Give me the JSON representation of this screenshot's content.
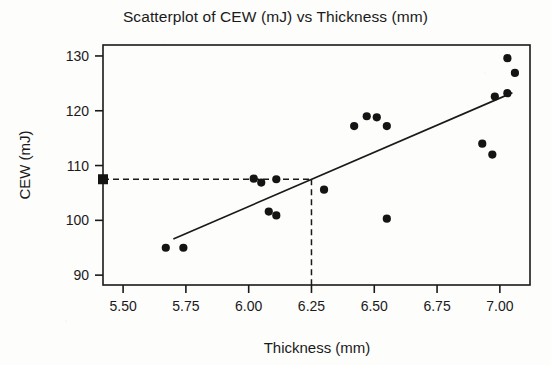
{
  "chart_data": {
    "type": "scatter",
    "title": "Scatterplot of CEW (mJ) vs Thickness (mm)",
    "xlabel": "Thickness (mm)",
    "ylabel": "CEW (mJ)",
    "xlim": [
      5.42,
      7.12
    ],
    "ylim": [
      88.2,
      132.0
    ],
    "xticks": [
      5.5,
      5.75,
      6.0,
      6.25,
      6.5,
      6.75,
      7.0
    ],
    "xtick_labels": [
      "5.50",
      "5.75",
      "6.00",
      "6.25",
      "6.50",
      "6.75",
      "7.00"
    ],
    "yticks": [
      90,
      100,
      110,
      120,
      130
    ],
    "ytick_labels": [
      "90",
      "100",
      "110",
      "120",
      "130"
    ],
    "grid": false,
    "legend": false,
    "marker": "filled-circle",
    "marker_color": "#141414",
    "points": [
      {
        "x": 5.67,
        "y": 95.0
      },
      {
        "x": 5.74,
        "y": 95.0
      },
      {
        "x": 6.02,
        "y": 107.6
      },
      {
        "x": 6.05,
        "y": 106.9
      },
      {
        "x": 6.11,
        "y": 107.5
      },
      {
        "x": 6.08,
        "y": 101.6
      },
      {
        "x": 6.11,
        "y": 100.9
      },
      {
        "x": 6.3,
        "y": 105.6
      },
      {
        "x": 6.42,
        "y": 117.2
      },
      {
        "x": 6.47,
        "y": 119.0
      },
      {
        "x": 6.51,
        "y": 118.8
      },
      {
        "x": 6.55,
        "y": 117.2
      },
      {
        "x": 6.55,
        "y": 100.3
      },
      {
        "x": 6.93,
        "y": 114.0
      },
      {
        "x": 6.97,
        "y": 112.0
      },
      {
        "x": 6.98,
        "y": 122.6
      },
      {
        "x": 7.03,
        "y": 123.2
      },
      {
        "x": 7.03,
        "y": 129.6
      },
      {
        "x": 7.06,
        "y": 126.9
      }
    ],
    "fit_line": {
      "name": "regression-line",
      "x_start": 5.7,
      "y_start": 96.6,
      "x_end": 7.05,
      "y_end": 123.3
    },
    "reference_lines": {
      "name": "prediction-guides",
      "style": "dashed",
      "x_value": 6.25,
      "y_value": 107.5,
      "marker": "filled-square",
      "marker_x": 5.42,
      "marker_y": 107.5
    }
  }
}
